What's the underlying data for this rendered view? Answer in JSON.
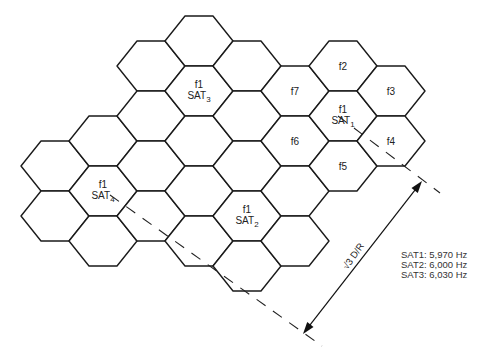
{
  "diagram": {
    "grid": {
      "origin": [
        199,
        41
      ],
      "col_dx": 48,
      "col_dy": 25,
      "row_dy": 50,
      "hex_half_width": 34,
      "hex_inset": 20,
      "hex_half_height": 25,
      "cells": [
        {
          "a": -3,
          "b": 4
        },
        {
          "a": -3,
          "b": 5
        },
        {
          "a": -2,
          "b": 3
        },
        {
          "a": -2,
          "b": 4,
          "label": "f1",
          "sat": "SAT",
          "sub": "4"
        },
        {
          "a": -2,
          "b": 5
        },
        {
          "a": -1,
          "b": 1
        },
        {
          "a": -1,
          "b": 2
        },
        {
          "a": -1,
          "b": 3
        },
        {
          "a": -1,
          "b": 4
        },
        {
          "a": 0,
          "b": 0
        },
        {
          "a": 0,
          "b": 1,
          "label": "f1",
          "sat": "SAT",
          "sub": "3"
        },
        {
          "a": 0,
          "b": 2
        },
        {
          "a": 0,
          "b": 3
        },
        {
          "a": 0,
          "b": 4
        },
        {
          "a": 1,
          "b": 0
        },
        {
          "a": 1,
          "b": 1
        },
        {
          "a": 1,
          "b": 2
        },
        {
          "a": 1,
          "b": 3,
          "label": "f1",
          "sat": "SAT",
          "sub": "2"
        },
        {
          "a": 1,
          "b": 4
        },
        {
          "a": 2,
          "b": 0,
          "label": "f7"
        },
        {
          "a": 2,
          "b": 1,
          "label": "f6"
        },
        {
          "a": 2,
          "b": 2
        },
        {
          "a": 2,
          "b": 3
        },
        {
          "a": 3,
          "b": -1,
          "label": "f2"
        },
        {
          "a": 3,
          "b": 0,
          "label": "f1",
          "sat": "SAT",
          "sub": "1"
        },
        {
          "a": 3,
          "b": 1,
          "label": "f5"
        },
        {
          "a": 4,
          "b": -1,
          "label": "f3"
        },
        {
          "a": 4,
          "b": 0,
          "label": "f4"
        }
      ]
    },
    "dashed_lines": [
      {
        "from": [
          338,
          116
        ],
        "to": [
          440,
          193
        ]
      },
      {
        "from": [
          110,
          195
        ],
        "to": [
          322,
          346
        ]
      }
    ],
    "dimension": {
      "from": [
        303,
        334
      ],
      "to": [
        422,
        181
      ],
      "label": "√3 D/R",
      "label_pos": [
        356,
        258
      ],
      "label_angle": -55
    },
    "legend": {
      "items": [
        "SAT1: 5,970 Hz",
        "SAT2: 6,000 Hz",
        "SAT3: 6,030 Hz"
      ]
    }
  }
}
